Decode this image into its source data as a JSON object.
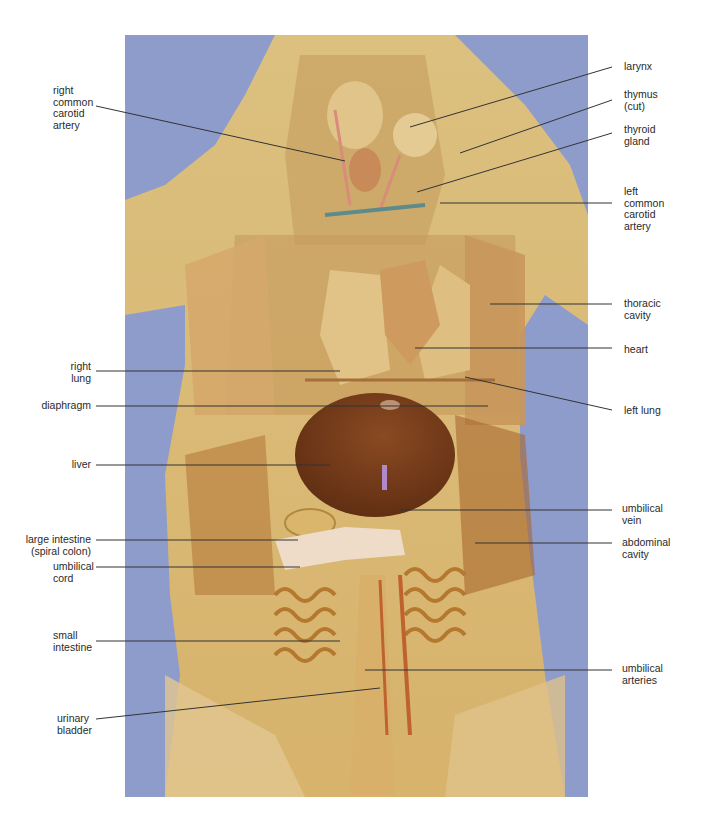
{
  "figure": {
    "photo_background_color": "#8e9ccb",
    "specimen_color": "#d8b877",
    "leader_line_color": "#333333"
  },
  "labels_left": [
    {
      "id": "right-common-carotid-artery",
      "lines": [
        "right",
        "common",
        "carotid",
        "artery"
      ]
    },
    {
      "id": "right-lung",
      "lines": [
        "right",
        "lung"
      ]
    },
    {
      "id": "diaphragm",
      "lines": [
        "diaphragm"
      ]
    },
    {
      "id": "liver",
      "lines": [
        "liver"
      ]
    },
    {
      "id": "large-intestine",
      "lines": [
        "large intestine",
        "(spiral colon)"
      ]
    },
    {
      "id": "umbilical-cord",
      "lines": [
        "umbilical",
        "cord"
      ]
    },
    {
      "id": "small-intestine",
      "lines": [
        "small",
        "intestine"
      ]
    },
    {
      "id": "urinary-bladder",
      "lines": [
        "urinary",
        "bladder"
      ]
    }
  ],
  "labels_right": [
    {
      "id": "larynx",
      "lines": [
        "larynx"
      ]
    },
    {
      "id": "thymus",
      "lines": [
        "thymus",
        "(cut)"
      ]
    },
    {
      "id": "thyroid-gland",
      "lines": [
        "thyroid",
        "gland"
      ]
    },
    {
      "id": "left-common-carotid-artery",
      "lines": [
        "left",
        "common",
        "carotid",
        "artery"
      ]
    },
    {
      "id": "thoracic-cavity",
      "lines": [
        "thoracic",
        "cavity"
      ]
    },
    {
      "id": "heart",
      "lines": [
        "heart"
      ]
    },
    {
      "id": "left-lung",
      "lines": [
        "left lung"
      ]
    },
    {
      "id": "umbilical-vein",
      "lines": [
        "umbilical",
        "vein"
      ]
    },
    {
      "id": "abdominal-cavity",
      "lines": [
        "abdominal",
        "cavity"
      ]
    },
    {
      "id": "umbilical-arteries",
      "lines": [
        "umbilical",
        "arteries"
      ]
    }
  ]
}
